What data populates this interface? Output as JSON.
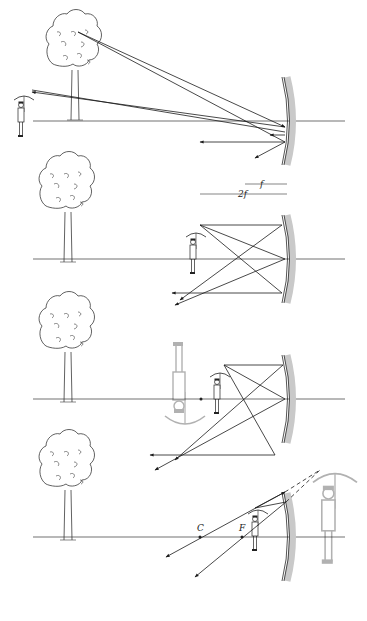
{
  "colors": {
    "ray": "#1a1a1a",
    "axis": "#333333",
    "mirror_shade": "#c9c9c9",
    "mirror_line": "#2a2a2a",
    "ghost": "#b5b5b5",
    "tree": "#3a3a3a"
  },
  "labels": {
    "f": "f",
    "two_f": "2f",
    "center": "C",
    "focus": "F"
  },
  "panels": [
    {
      "id": "far",
      "axis_y": 121,
      "mirror_x": 287,
      "tree_x": 68,
      "person_x": 22,
      "caption": "Object beyond 2f"
    },
    {
      "id": "at2f",
      "axis_y": 259,
      "mirror_x": 287,
      "tree_x": 68,
      "person_x": 196,
      "caption": "Object between f and 2f"
    },
    {
      "id": "between",
      "axis_y": 399,
      "mirror_x": 287,
      "tree_x": 68,
      "person_x": 216,
      "caption": "Object between f and 2f (larger image)"
    },
    {
      "id": "inside",
      "axis_y": 537,
      "mirror_x": 287,
      "tree_x": 68,
      "person_x": 256,
      "caption": "Object inside f (virtual image)"
    }
  ]
}
